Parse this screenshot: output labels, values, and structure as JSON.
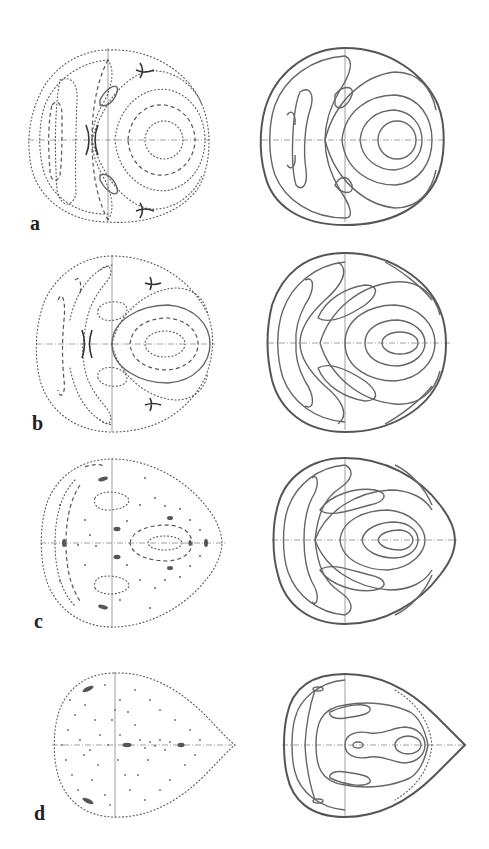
{
  "figure": {
    "rows": [
      {
        "id": "a",
        "label": "a",
        "left": "dotted Poincaré section, near-circular boundary",
        "right": "smooth contour curves, near-circular boundary"
      },
      {
        "id": "b",
        "label": "b",
        "left": "dotted Poincaré section, slightly oval boundary",
        "right": "smooth contour curves, oval boundary"
      },
      {
        "id": "c",
        "label": "c",
        "left": "dotted Poincaré section with scattered points, egg-shaped boundary",
        "right": "smooth contour curves, egg-shaped boundary"
      },
      {
        "id": "d",
        "label": "d",
        "left": "chaotic scattered points, teardrop boundary",
        "right": "smooth contour curves, teardrop boundary"
      }
    ]
  },
  "colors": {
    "background": "#ffffff",
    "ink": "#555555",
    "label": "#222222"
  }
}
